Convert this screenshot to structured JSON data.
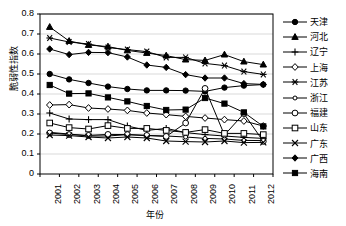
{
  "axes": {
    "ylabel": "脆弱性指数",
    "xlabel": "年份",
    "yticks": [
      "0.8",
      "0.7",
      "0.6",
      "0.5",
      "0.4",
      "0.3",
      "0.2",
      "0.1",
      "0"
    ],
    "ylim": [
      0,
      0.8
    ],
    "xticks": [
      "2001",
      "2002",
      "2003",
      "2004",
      "2005",
      "2006",
      "2007",
      "2008",
      "2009",
      "2010",
      "2011",
      "2012"
    ],
    "grid": "horizontal",
    "line_color": "#000000",
    "grid_color": "#d9d9d9"
  },
  "legend": {
    "position": "right",
    "items": [
      {
        "label": "天津",
        "marker": "filled-circle"
      },
      {
        "label": "河北",
        "marker": "filled-triangle"
      },
      {
        "label": "辽宁",
        "marker": "plus"
      },
      {
        "label": "上海",
        "marker": "open-diamond"
      },
      {
        "label": "江苏",
        "marker": "star"
      },
      {
        "label": "浙江",
        "marker": "small-open-circle"
      },
      {
        "label": "福建",
        "marker": "open-circle"
      },
      {
        "label": "山东",
        "marker": "open-square"
      },
      {
        "label": "广东",
        "marker": "cross"
      },
      {
        "label": "广西",
        "marker": "filled-diamond"
      },
      {
        "label": "海南",
        "marker": "filled-square"
      }
    ]
  },
  "chart_data": {
    "type": "line",
    "title": "",
    "xlabel": "年份",
    "ylabel": "脆弱性指数",
    "ylim": [
      0,
      0.8
    ],
    "grid": true,
    "legend_position": "right",
    "x": [
      "2001",
      "2002",
      "2003",
      "2004",
      "2005",
      "2006",
      "2007",
      "2008",
      "2009",
      "2010",
      "2011",
      "2012"
    ],
    "series": [
      {
        "name": "天津",
        "marker": "filled-circle",
        "values": [
          0.5,
          0.473,
          0.455,
          0.437,
          0.425,
          0.418,
          0.418,
          0.417,
          0.413,
          0.432,
          0.442,
          0.447
        ]
      },
      {
        "name": "河北",
        "marker": "filled-triangle",
        "values": [
          0.735,
          0.665,
          0.645,
          0.637,
          0.618,
          0.605,
          0.592,
          0.572,
          0.568,
          0.597,
          0.562,
          0.547
        ]
      },
      {
        "name": "辽宁",
        "marker": "plus",
        "values": [
          0.305,
          0.275,
          0.272,
          0.272,
          0.24,
          0.218,
          0.228,
          0.207,
          0.197,
          0.19,
          0.183,
          0.178
        ]
      },
      {
        "name": "上海",
        "marker": "open-diamond",
        "values": [
          0.345,
          0.347,
          0.33,
          0.325,
          0.318,
          0.305,
          0.297,
          0.288,
          0.28,
          0.272,
          0.265,
          0.24
        ]
      },
      {
        "name": "江苏",
        "marker": "star",
        "values": [
          0.68,
          0.66,
          0.65,
          0.632,
          0.622,
          0.612,
          0.583,
          0.583,
          0.553,
          0.542,
          0.512,
          0.498
        ]
      },
      {
        "name": "浙江",
        "marker": "small-open-circle",
        "values": [
          0.208,
          0.2,
          0.19,
          0.19,
          0.197,
          0.192,
          0.19,
          0.185,
          0.178,
          0.175,
          0.168,
          0.167
        ]
      },
      {
        "name": "福建",
        "marker": "open-circle",
        "values": [
          0.205,
          0.197,
          0.193,
          0.198,
          0.197,
          0.193,
          0.188,
          0.255,
          0.428,
          0.195,
          0.302,
          0.163
        ]
      },
      {
        "name": "山东",
        "marker": "open-square",
        "values": [
          0.255,
          0.232,
          0.225,
          0.242,
          0.228,
          0.228,
          0.218,
          0.208,
          0.222,
          0.203,
          0.203,
          0.197
        ]
      },
      {
        "name": "广东",
        "marker": "cross",
        "values": [
          0.195,
          0.192,
          0.185,
          0.18,
          0.185,
          0.18,
          0.165,
          0.162,
          0.16,
          0.165,
          0.157,
          0.158
        ]
      },
      {
        "name": "广西",
        "marker": "filled-diamond",
        "values": [
          0.625,
          0.597,
          0.608,
          0.607,
          0.585,
          0.545,
          0.533,
          0.497,
          0.48,
          0.48,
          0.452,
          0.448
        ]
      },
      {
        "name": "海南",
        "marker": "filled-square",
        "values": [
          0.445,
          0.402,
          0.403,
          0.383,
          0.363,
          0.34,
          0.32,
          0.322,
          0.38,
          0.352,
          0.308,
          0.238
        ]
      }
    ]
  }
}
